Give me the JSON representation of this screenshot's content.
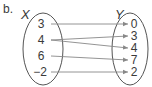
{
  "part_label": "b.",
  "domain_set": {
    "label": "X",
    "values": [
      "3",
      "4",
      "6",
      "−2"
    ]
  },
  "range_set": {
    "label": "Y",
    "values": [
      "0",
      "3",
      "4",
      "7",
      "2"
    ]
  },
  "mappings": [
    {
      "from": "3",
      "to": "0"
    },
    {
      "from": "4",
      "to": "3"
    },
    {
      "from": "4",
      "to": "4"
    },
    {
      "from": "6",
      "to": "7"
    },
    {
      "from": "−2",
      "to": "2"
    }
  ],
  "colors": {
    "stroke": "#555555",
    "arrow": "#888888",
    "text": "#3a3a3a"
  }
}
